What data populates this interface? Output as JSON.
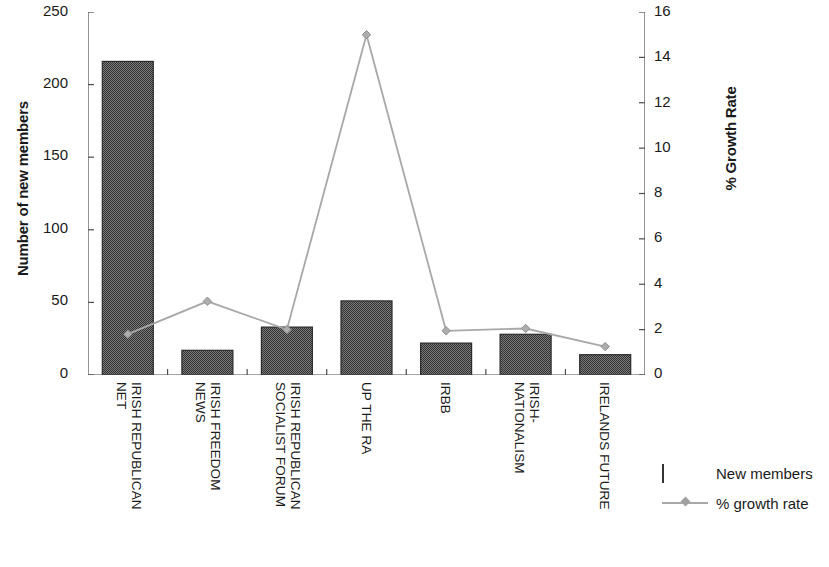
{
  "chart_data": {
    "type": "bar",
    "title": "",
    "categories": [
      "IRISH REPUBLICAN NET",
      "IRISH FREEDOM NEWS",
      "IRISH REPUBLICAN SOCIALIST FORUM",
      "UP THE RA",
      "IRBB",
      "IRISH-NATIONALISM",
      "IRELANDS FUTURE"
    ],
    "category_lines": [
      [
        "IRISH REPUBLICAN",
        "NET"
      ],
      [
        "IRISH FREEDOM",
        "NEWS"
      ],
      [
        "IRISH REPUBLICAN",
        "SOCIALIST FORUM"
      ],
      [
        "UP THE RA",
        ""
      ],
      [
        "IRBB",
        ""
      ],
      [
        "IRISH-",
        "NATIONALISM"
      ],
      [
        "IRELANDS FUTURE",
        ""
      ]
    ],
    "series": [
      {
        "name": "New members",
        "type": "bar",
        "axis": "left",
        "values": [
          216,
          17,
          33,
          51,
          22,
          28,
          14
        ],
        "color": "#6e6e6e"
      },
      {
        "name": "% growth rate",
        "type": "line",
        "axis": "right",
        "values": [
          1.8,
          3.25,
          2.0,
          15.0,
          1.95,
          2.05,
          1.25
        ],
        "color": "#a8a8a8"
      }
    ],
    "xlabel": "",
    "ylabel": "Number of new members",
    "y2label": "% Growth Rate",
    "ylim": [
      0,
      250
    ],
    "y2lim": [
      0,
      16
    ],
    "yticks": [
      0,
      50,
      100,
      150,
      200,
      250
    ],
    "y2ticks": [
      0,
      2,
      4,
      6,
      8,
      10,
      12,
      14,
      16
    ],
    "grid": false,
    "legend_position": "bottom-right"
  },
  "axes": {
    "left": {
      "title": "Number of new members",
      "ticks": [
        "0",
        "50",
        "100",
        "150",
        "200",
        "250"
      ]
    },
    "right": {
      "title": "% Growth Rate",
      "ticks": [
        "0",
        "2",
        "4",
        "6",
        "8",
        "10",
        "12",
        "14",
        "16"
      ]
    }
  },
  "legend": {
    "items": [
      {
        "label": "New members",
        "key": "bar-swatch"
      },
      {
        "label": "% growth rate",
        "key": "line-swatch"
      }
    ]
  }
}
